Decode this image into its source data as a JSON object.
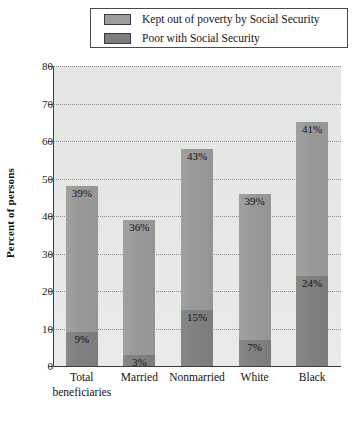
{
  "chart_data": {
    "type": "bar",
    "subtype": "stacked-bar",
    "title": "",
    "xlabel": "",
    "ylabel": "Percent of persons",
    "ylim": [
      0,
      80
    ],
    "ytick_step": 10,
    "yticks": [
      "80",
      "70",
      "60",
      "50",
      "40",
      "30",
      "20",
      "10",
      "0"
    ],
    "grid": true,
    "grid_style": "dotted-horizontal",
    "legend_position": "top",
    "categories": [
      "Total beneficiaries",
      "Married",
      "Nonmarried",
      "White",
      "Black"
    ],
    "category_lines": [
      [
        "Total",
        "beneficiaries"
      ],
      [
        "Married",
        ""
      ],
      [
        "Nonmarried",
        ""
      ],
      [
        "White",
        ""
      ],
      [
        "Black",
        ""
      ]
    ],
    "series": [
      {
        "name": "Kept out of poverty by Social Security",
        "color": "#9a9a9a",
        "values": [
          39,
          36,
          43,
          39,
          41
        ],
        "labels": [
          "39%",
          "36%",
          "43%",
          "39%",
          "41%"
        ]
      },
      {
        "name": "Poor with Social Security",
        "color": "#818181",
        "values": [
          9,
          3,
          15,
          7,
          24
        ],
        "labels": [
          "9%",
          "3%",
          "15%",
          "7%",
          "24%"
        ]
      }
    ],
    "totals": [
      48,
      39,
      58,
      46,
      65
    ]
  },
  "legend": {
    "entries": [
      {
        "label": "Kept out of poverty by Social Security",
        "swatch": "light-gray-swatch"
      },
      {
        "label": "Poor with Social Security",
        "swatch": "dark-gray-swatch"
      }
    ]
  },
  "colors": {
    "plot_background": "#e6e8e6",
    "axis": "#3c3c3c",
    "grid": "#8e8e8e",
    "series_light": "#9a9a9a",
    "series_dark": "#818181",
    "text": "#141414"
  }
}
